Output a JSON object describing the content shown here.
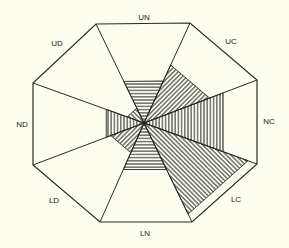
{
  "diagram": {
    "type": "octagonal-rose",
    "center": [
      144,
      123
    ],
    "outline_vertices": [
      [
        96,
        24
      ],
      [
        190,
        23
      ],
      [
        257,
        80
      ],
      [
        257,
        164
      ],
      [
        192,
        222
      ],
      [
        100,
        222
      ],
      [
        33,
        165
      ],
      [
        33,
        83
      ]
    ],
    "colors": {
      "background": "#fdfdf0",
      "stroke": "#2a2a2a"
    },
    "sectors": [
      {
        "id": "UN",
        "label": "UN",
        "label_pos": [
          144,
          17
        ],
        "outer": [
          [
            96,
            24
          ],
          [
            190,
            23
          ]
        ],
        "fill_fraction": 0.42,
        "hatch": "horizontal"
      },
      {
        "id": "UC",
        "label": "UC",
        "label_pos": [
          231,
          41
        ],
        "outer": [
          [
            190,
            23
          ],
          [
            257,
            80
          ]
        ],
        "fill_fraction": 0.58,
        "hatch": "diagonal-up"
      },
      {
        "id": "NC",
        "label": "NC",
        "label_pos": [
          269,
          121
        ],
        "outer": [
          [
            257,
            80
          ],
          [
            257,
            164
          ]
        ],
        "fill_fraction": 0.7,
        "hatch": "vertical"
      },
      {
        "id": "LC",
        "label": "LC",
        "label_pos": [
          236,
          199
        ],
        "outer": [
          [
            257,
            164
          ],
          [
            192,
            222
          ]
        ],
        "fill_fraction": 0.92,
        "hatch": "diagonal-down"
      },
      {
        "id": "LN",
        "label": "LN",
        "label_pos": [
          145,
          233
        ],
        "outer": [
          [
            192,
            222
          ],
          [
            100,
            222
          ]
        ],
        "fill_fraction": 0.47,
        "hatch": "horizontal"
      },
      {
        "id": "LD",
        "label": "LD",
        "label_pos": [
          54,
          200
        ],
        "outer": [
          [
            100,
            222
          ],
          [
            33,
            165
          ]
        ],
        "fill_fraction": 0.3,
        "hatch": "diagonal-up"
      },
      {
        "id": "ND",
        "label": "ND",
        "label_pos": [
          22,
          124
        ],
        "outer": [
          [
            33,
            165
          ],
          [
            33,
            83
          ]
        ],
        "fill_fraction": 0.34,
        "hatch": "vertical"
      },
      {
        "id": "UD",
        "label": "UD",
        "label_pos": [
          57,
          43
        ],
        "outer": [
          [
            33,
            83
          ],
          [
            96,
            24
          ]
        ],
        "fill_fraction": 0.15,
        "hatch": "diagonal-down"
      }
    ]
  }
}
